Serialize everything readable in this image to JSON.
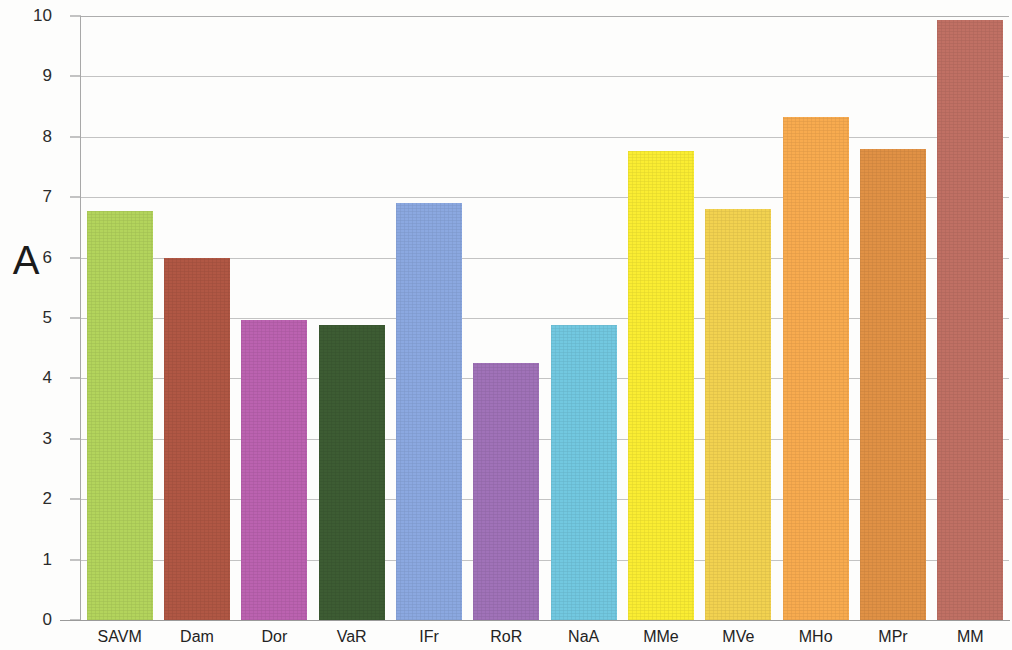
{
  "panel": {
    "letter": "A"
  },
  "chart_data": {
    "type": "bar",
    "title": "",
    "subtitle": "",
    "xlabel": "",
    "ylabel": "",
    "ylim": [
      0,
      10
    ],
    "xlim_note": "categorical",
    "grid": true,
    "grid_axis": "y",
    "legend": false,
    "legend_position": "none",
    "annotations": [
      "A"
    ],
    "ytick_labels": [
      "0",
      "1",
      "2",
      "3",
      "4",
      "5",
      "6",
      "7",
      "8",
      "9",
      "10"
    ],
    "yticks": [
      0,
      1,
      2,
      3,
      4,
      5,
      6,
      7,
      8,
      9,
      10
    ],
    "categories": [
      "SAVM",
      "Dam",
      "Dor",
      "VaR",
      "IFr",
      "RoR",
      "NaA",
      "MMe",
      "MVe",
      "MHo",
      "MPr",
      "MM"
    ],
    "values": [
      6.77,
      6.0,
      4.96,
      4.89,
      6.9,
      4.25,
      4.89,
      7.77,
      6.8,
      8.32,
      7.79,
      9.94
    ],
    "colors": [
      "#b3d45c",
      "#b05744",
      "#bb62b0",
      "#3d5c33",
      "#8ba8e0",
      "#a072b8",
      "#72c8e0",
      "#faed32",
      "#f2d250",
      "#f8ab4f",
      "#e09145",
      "#c07064"
    ],
    "bars": [
      {
        "label": "SAVM",
        "value": 6.77,
        "color": "#b3d45c"
      },
      {
        "label": "Dam",
        "value": 6.0,
        "color": "#b05744"
      },
      {
        "label": "Dor",
        "value": 4.96,
        "color": "#bb62b0"
      },
      {
        "label": "VaR",
        "value": 4.89,
        "color": "#3d5c33"
      },
      {
        "label": "IFr",
        "value": 6.9,
        "color": "#8ba8e0"
      },
      {
        "label": "RoR",
        "value": 4.25,
        "color": "#a072b8"
      },
      {
        "label": "NaA",
        "value": 4.89,
        "color": "#72c8e0"
      },
      {
        "label": "MMe",
        "value": 7.77,
        "color": "#faed32"
      },
      {
        "label": "MVe",
        "value": 6.8,
        "color": "#f2d250"
      },
      {
        "label": "MHo",
        "value": 8.32,
        "color": "#f8ab4f"
      },
      {
        "label": "MPr",
        "value": 7.79,
        "color": "#e09145"
      },
      {
        "label": "MM",
        "value": 9.94,
        "color": "#c07064"
      }
    ]
  }
}
